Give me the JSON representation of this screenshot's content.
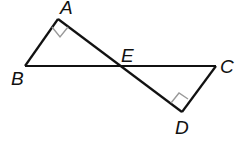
{
  "diagram": {
    "type": "geometry",
    "points": {
      "A": {
        "label": "A",
        "x": 58,
        "y": 19
      },
      "B": {
        "label": "B",
        "x": 25,
        "y": 66
      },
      "E": {
        "label": "E",
        "x": 120,
        "y": 66
      },
      "C": {
        "label": "C",
        "x": 216,
        "y": 66
      },
      "D": {
        "label": "D",
        "x": 182,
        "y": 112
      }
    },
    "segments": [
      "AB",
      "AD",
      "BC",
      "CD"
    ],
    "right_angles": [
      "A",
      "D"
    ],
    "colors": {
      "line": "#111111",
      "right_angle_mark": "#999999"
    }
  }
}
